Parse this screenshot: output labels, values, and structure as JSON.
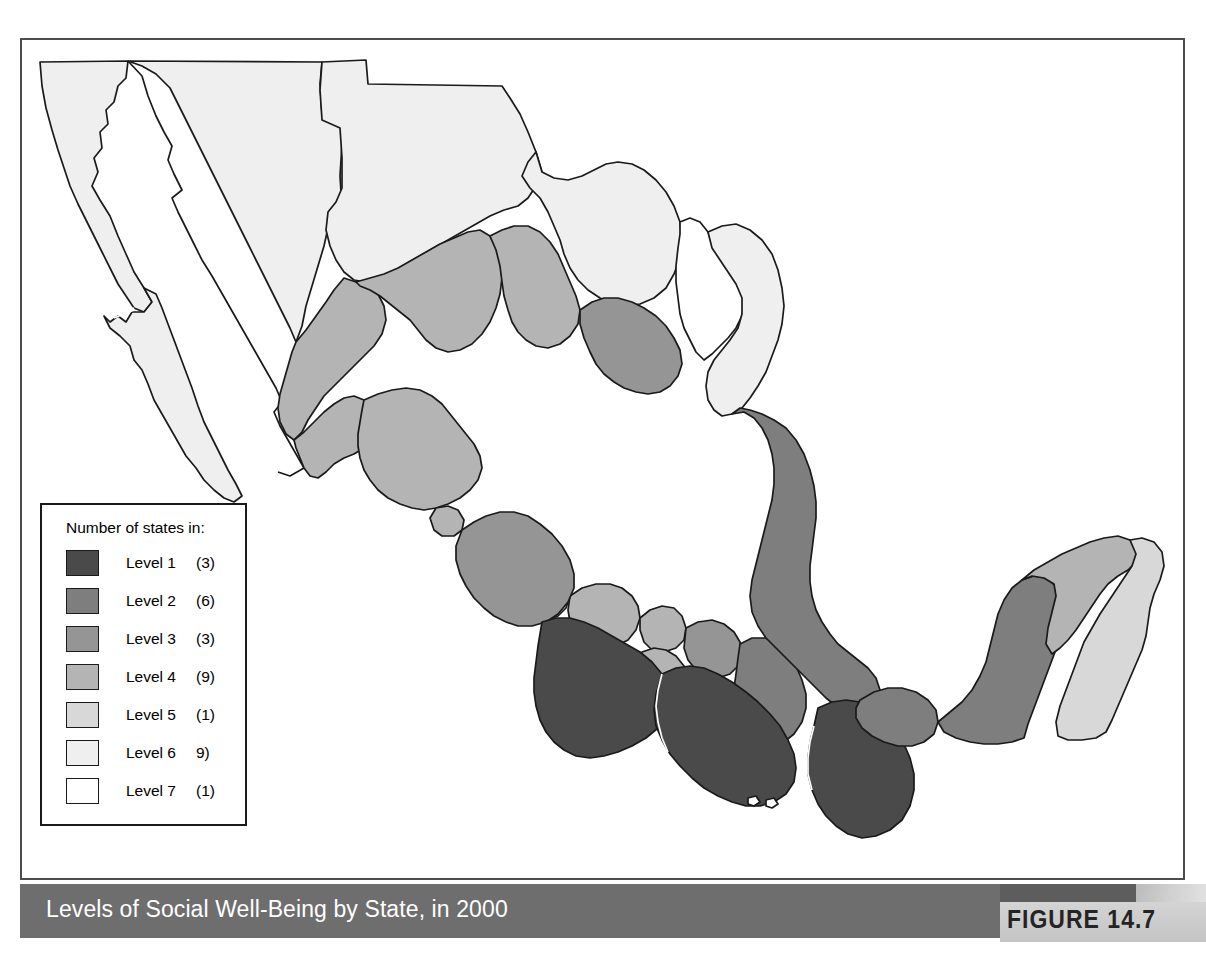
{
  "figure": {
    "caption": "Levels of Social Well-Being by State, in 2000",
    "figure_label": "FIGURE 14.7",
    "caption_bar_color": "#6e6e6e",
    "caption_text_color": "#ffffff",
    "frame_color": "#4c4c4c"
  },
  "legend": {
    "title": "Number of states in:",
    "rows": [
      {
        "label": "Level 1",
        "count": "(3)",
        "color": "#4a4a4a",
        "states": 3
      },
      {
        "label": "Level 2",
        "count": "(6)",
        "color": "#7e7e7e",
        "states": 6
      },
      {
        "label": "Level 3",
        "count": "(3)",
        "color": "#959595",
        "states": 3
      },
      {
        "label": "Level 4",
        "count": "(9)",
        "color": "#b4b4b4",
        "states": 9
      },
      {
        "label": "Level 5",
        "count": "(1)",
        "color": "#d8d8d8",
        "states": 1
      },
      {
        "label": "Level 6",
        "count": "9)",
        "color": "#efefef",
        "states": 9
      },
      {
        "label": "Level 7",
        "count": "(1)",
        "color": "#ffffff",
        "states": 1
      }
    ]
  },
  "map": {
    "title": "Levels of Social Well-Being by State, in 2000",
    "country": "Mexico",
    "unit": "state",
    "classification_scheme": "Level 1 (lowest well-being, darkest) through Level 7 (highest well-being, lightest)",
    "total_states": 32,
    "state_levels": [
      {
        "name": "Baja California",
        "level": 6
      },
      {
        "name": "Baja California Sur",
        "level": 6
      },
      {
        "name": "Sonora",
        "level": 6
      },
      {
        "name": "Chihuahua",
        "level": 6
      },
      {
        "name": "Coahuila",
        "level": 6
      },
      {
        "name": "Nuevo Leon",
        "level": 7
      },
      {
        "name": "Tamaulipas",
        "level": 6
      },
      {
        "name": "Sinaloa",
        "level": 4
      },
      {
        "name": "Durango",
        "level": 4
      },
      {
        "name": "Zacatecas",
        "level": 4
      },
      {
        "name": "San Luis Potosi",
        "level": 3
      },
      {
        "name": "Nayarit",
        "level": 4
      },
      {
        "name": "Jalisco",
        "level": 4
      },
      {
        "name": "Aguascalientes",
        "level": 5
      },
      {
        "name": "Guanajuato",
        "level": 4
      },
      {
        "name": "Queretaro",
        "level": 4
      },
      {
        "name": "Hidalgo",
        "level": 3
      },
      {
        "name": "Veracruz",
        "level": 2
      },
      {
        "name": "Colima",
        "level": 4
      },
      {
        "name": "Michoacan",
        "level": 3
      },
      {
        "name": "Mexico",
        "level": 4
      },
      {
        "name": "Distrito Federal",
        "level": 7
      },
      {
        "name": "Morelos",
        "level": 4
      },
      {
        "name": "Tlaxcala",
        "level": 4
      },
      {
        "name": "Puebla",
        "level": 2
      },
      {
        "name": "Guerrero",
        "level": 1
      },
      {
        "name": "Oaxaca",
        "level": 1
      },
      {
        "name": "Chiapas",
        "level": 1
      },
      {
        "name": "Tabasco",
        "level": 2
      },
      {
        "name": "Campeche",
        "level": 2
      },
      {
        "name": "Yucatan",
        "level": 4
      },
      {
        "name": "Quintana Roo",
        "level": 5
      }
    ],
    "level_counts": {
      "1": 3,
      "2": 6,
      "3": 3,
      "4": 9,
      "5": 1,
      "6": 9,
      "7": 1
    }
  }
}
